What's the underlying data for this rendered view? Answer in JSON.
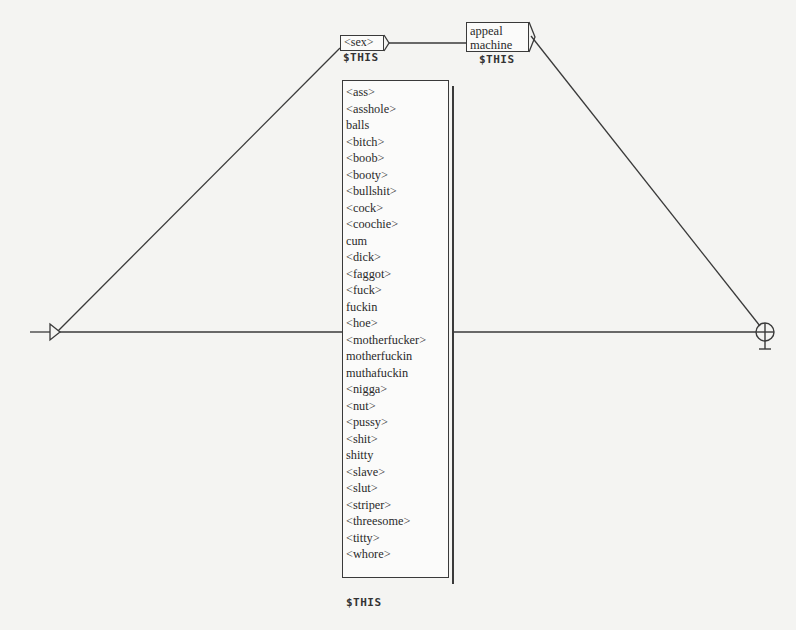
{
  "graph": {
    "nodes": {
      "sex_box": {
        "label": "<sex>",
        "output": "$THIS"
      },
      "appeal_box": {
        "lines": [
          "appeal",
          "machine"
        ],
        "output": "$THIS"
      },
      "list_box": {
        "items": [
          "<ass>",
          "<asshole>",
          "balls",
          "<bitch>",
          "<boob>",
          "<booty>",
          "<bullshit>",
          "<cock>",
          "<coochie>",
          "cum",
          "<dick>",
          "<faggot>",
          "<fuck>",
          "fuckin",
          "<hoe>",
          "<motherfucker>",
          "motherfuckin",
          "muthafuckin",
          "<nigga>",
          "<nut>",
          "<pussy>",
          "<shit>",
          "shitty",
          "<slave>",
          "<slut>",
          "<striper>",
          "<threesome>",
          "<titty>",
          "<whore>"
        ],
        "output": "$THIS"
      }
    },
    "initial_state": {
      "icon": "triangle-arrow-icon"
    },
    "final_state": {
      "icon": "crossed-circle-icon"
    },
    "colors": {
      "line": "#3a3a3a",
      "background": "#f4f4f2",
      "box_fill": "#fbfbfa"
    }
  }
}
